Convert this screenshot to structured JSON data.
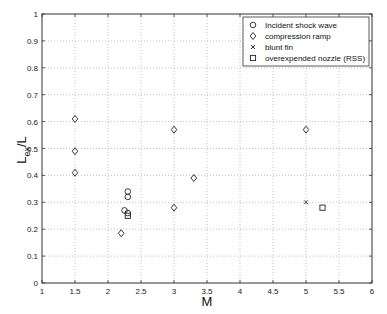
{
  "chart_data": {
    "type": "scatter",
    "title": "",
    "xlabel": "M",
    "ylabel": "L_ex/L",
    "ylabel_main": "L",
    "ylabel_sub": "ex",
    "ylabel_tail": "/L",
    "xlim": [
      1,
      6
    ],
    "ylim": [
      0,
      1
    ],
    "grid": true,
    "legend_position": "upper right",
    "x_ticks": [
      "1",
      "1.5",
      "2",
      "2.5",
      "3",
      "3.5",
      "4",
      "4.5",
      "5",
      "5.5",
      "6"
    ],
    "y_ticks": [
      "0",
      "0.1",
      "0.2",
      "0.3",
      "0.4",
      "0.5",
      "0.6",
      "0.7",
      "0.8",
      "0.9",
      "1"
    ],
    "series": [
      {
        "name": "Incident shock wave",
        "marker": "circle",
        "points": [
          [
            2.3,
            0.34
          ],
          [
            2.3,
            0.32
          ],
          [
            2.25,
            0.27
          ],
          [
            2.3,
            0.26
          ]
        ]
      },
      {
        "name": "compression ramp",
        "marker": "diamond",
        "points": [
          [
            1.5,
            0.61
          ],
          [
            1.5,
            0.49
          ],
          [
            1.5,
            0.41
          ],
          [
            2.2,
            0.185
          ],
          [
            3.0,
            0.57
          ],
          [
            3.0,
            0.28
          ],
          [
            3.3,
            0.39
          ],
          [
            5.0,
            0.57
          ]
        ]
      },
      {
        "name": "blunt fin",
        "marker": "x",
        "points": [
          [
            5.0,
            0.3
          ]
        ]
      },
      {
        "name": "overexpended nozzle (RSS)",
        "marker": "square",
        "points": [
          [
            2.3,
            0.25
          ],
          [
            5.25,
            0.28
          ]
        ]
      }
    ]
  }
}
